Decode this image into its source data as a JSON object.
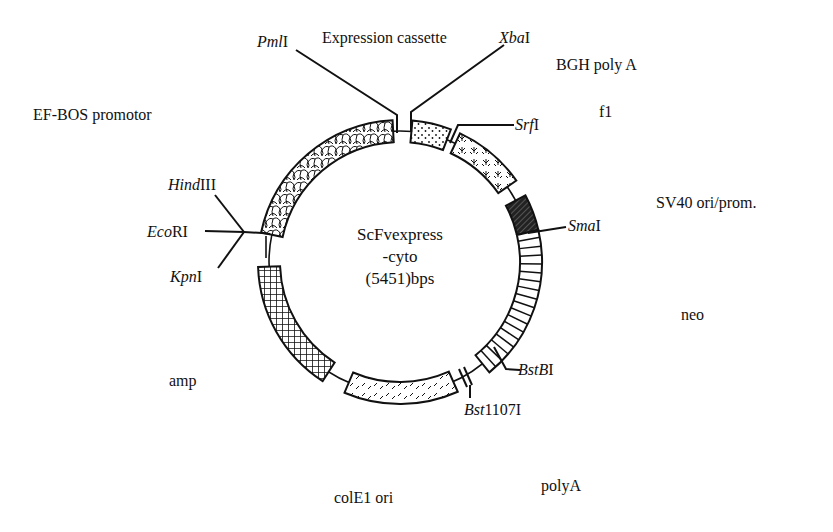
{
  "plasmid": {
    "name_line1": "ScFvexpress",
    "name_line2": "-cyto",
    "size_label": "(5451)bps",
    "size_bp": 5451
  },
  "geometry": {
    "cx": 400,
    "cy": 262,
    "r": 131,
    "r_inner": 120,
    "r_outer": 142
  },
  "features": [
    {
      "id": "ef-bos",
      "label": "EF-BOS promotor",
      "start_deg": -78,
      "end_deg": -3,
      "pattern": "cobble",
      "label_x": 33,
      "label_y": 107
    },
    {
      "id": "expression-cassette",
      "label": "Expression cassette",
      "start_deg": 5,
      "end_deg": 21,
      "pattern": "dots",
      "label_x": 322,
      "label_y": 30
    },
    {
      "id": "bgh-polya",
      "label": "BGH poly A",
      "start_deg": 5,
      "end_deg": 21,
      "pattern": "dots",
      "label_x": 556,
      "label_y": 57
    },
    {
      "id": "f1",
      "label": "f1",
      "start_deg": 25,
      "end_deg": 55,
      "pattern": "tree",
      "label_x": 599,
      "label_y": 104
    },
    {
      "id": "sv40",
      "label": "SV40 ori/prom.",
      "start_deg": 62,
      "end_deg": 77,
      "pattern": "dark-hatch",
      "label_x": 656,
      "label_y": 195
    },
    {
      "id": "neo",
      "label": "neo",
      "start_deg": 77,
      "end_deg": 141,
      "pattern": "hlines",
      "label_x": 681,
      "label_y": 307
    },
    {
      "id": "colE1",
      "label": "colE1 ori",
      "start_deg": 156,
      "end_deg": 203,
      "pattern": "dash",
      "label_x": 334,
      "label_y": 490
    },
    {
      "id": "polyA",
      "label": "polyA",
      "start_deg": 0,
      "end_deg": 0,
      "pattern": "none",
      "label_x": 541,
      "label_y": 478
    },
    {
      "id": "amp",
      "label": "amp",
      "start_deg": 213,
      "end_deg": 268,
      "pattern": "grid",
      "label_x": 169,
      "label_y": 373
    }
  ],
  "sites": [
    {
      "id": "pmli",
      "italic": "Pml",
      "roman": "I",
      "label_x": 257,
      "label_y": 34
    },
    {
      "id": "xbai",
      "italic": "Xba",
      "roman": "I",
      "label_x": 499,
      "label_y": 30
    },
    {
      "id": "srfi",
      "italic": "Srf",
      "roman": "I",
      "label_x": 513,
      "label_y": 123
    },
    {
      "id": "smai",
      "italic": "Sma",
      "roman": "I",
      "label_x": 568,
      "label_y": 225
    },
    {
      "id": "bstbi",
      "italic": "BstB",
      "roman": "I",
      "label_x": 518,
      "label_y": 367
    },
    {
      "id": "bst1107i",
      "italic": "Bst",
      "roman": "1107I",
      "label_x": 464,
      "label_y": 405
    },
    {
      "id": "hindiii",
      "italic": "Hind",
      "roman": "III",
      "label_x": 168,
      "label_y": 177
    },
    {
      "id": "ecori",
      "italic": "Eco",
      "roman": "RI",
      "label_x": 147,
      "label_y": 225
    },
    {
      "id": "kpni",
      "italic": "Kpn",
      "roman": "I",
      "label_x": 170,
      "label_y": 272
    }
  ],
  "colors": {
    "ink": "#111111",
    "background": "#ffffff"
  }
}
